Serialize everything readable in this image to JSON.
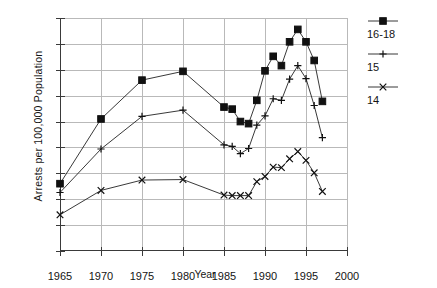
{
  "chart_data": {
    "type": "line",
    "title": "",
    "xlabel": "Year",
    "ylabel": "Arrests per 100,000 Population",
    "xlim": [
      1965,
      2000
    ],
    "ylim": [
      0,
      450
    ],
    "xticks": [
      "1965",
      "1970",
      "1975",
      "1980",
      "1985",
      "1990",
      "1995",
      "2000"
    ],
    "yticks": [
      "0",
      "50",
      "100",
      "150",
      "200",
      "250",
      "300",
      "350",
      "400",
      "450"
    ],
    "grid": true,
    "legend_position": "right",
    "series": [
      {
        "name": "16-18",
        "marker": "filled-square",
        "x": [
          1965,
          1970,
          1975,
          1980,
          1985,
          1986,
          1987,
          1988,
          1989,
          1990,
          1991,
          1992,
          1993,
          1994,
          1995,
          1996,
          1997
        ],
        "values": [
          130,
          255,
          330,
          347,
          278,
          274,
          250,
          246,
          291,
          348,
          376,
          358,
          404,
          428,
          404,
          368,
          289
        ]
      },
      {
        "name": "15",
        "marker": "plus",
        "x": [
          1965,
          1970,
          1975,
          1980,
          1985,
          1986,
          1987,
          1988,
          1989,
          1990,
          1991,
          1992,
          1993,
          1994,
          1995,
          1996,
          1997
        ],
        "values": [
          113,
          197,
          260,
          272,
          205,
          202,
          188,
          198,
          243,
          261,
          294,
          291,
          332,
          358,
          333,
          281,
          219
        ]
      },
      {
        "name": "14",
        "marker": "cross",
        "x": [
          1965,
          1970,
          1975,
          1980,
          1985,
          1986,
          1987,
          1988,
          1989,
          1990,
          1991,
          1992,
          1993,
          1994,
          1995,
          1996,
          1997
        ],
        "values": [
          70,
          117,
          137,
          138,
          108,
          107,
          107,
          107,
          134,
          144,
          162,
          161,
          178,
          192,
          175,
          151,
          115
        ]
      }
    ]
  },
  "legend": {
    "items": [
      {
        "label": "16-18",
        "marker": "filled-square"
      },
      {
        "label": "15",
        "marker": "plus"
      },
      {
        "label": "14",
        "marker": "cross"
      }
    ]
  }
}
